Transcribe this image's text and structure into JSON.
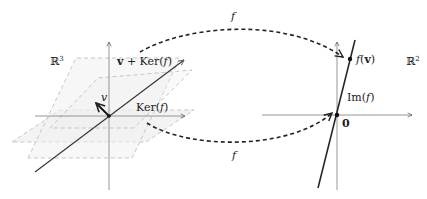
{
  "diagram": {
    "domain_space": {
      "label": "ℝ³",
      "label_base": "ℝ",
      "label_sup": "3",
      "affine_plane_label_v": "v",
      "affine_plane_label_rest": " + Ker(",
      "affine_plane_label_f": "f",
      "affine_plane_label_close": ")",
      "kernel_label_prefix": "Ker(",
      "kernel_label_f": "f",
      "kernel_label_close": ")",
      "vector_label": "v"
    },
    "codomain_space": {
      "label": "ℝ²",
      "label_base": "ℝ",
      "label_sup": "2",
      "image_label_prefix": "Im(",
      "image_label_f": "f",
      "image_label_close": ")",
      "point_fv_f": "f",
      "point_fv_open": "(",
      "point_fv_v": "v",
      "point_fv_close": ")",
      "origin_label": "0"
    },
    "mappings": {
      "top_arrow_label": "f",
      "bottom_arrow_label": "f"
    },
    "colors": {
      "axis": "#8a8a8a",
      "plane_dash": "#b9b9b9",
      "plane_fill": "#f2f2f2",
      "ink": "#222222"
    }
  }
}
